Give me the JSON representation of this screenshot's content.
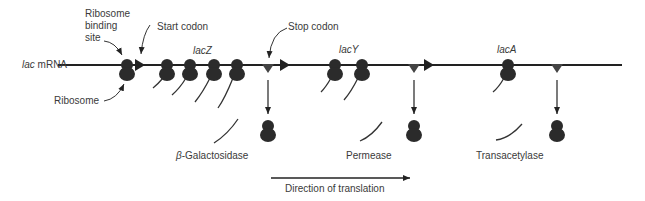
{
  "diagram": {
    "mrna_label_italic": "lac",
    "mrna_label_rest": " mRNA",
    "labels": {
      "ribosome_binding_site": [
        "Ribosome",
        "binding",
        "site"
      ],
      "start_codon": "Start codon",
      "stop_codon": "Stop codon",
      "ribosome": "Ribosome",
      "direction": "Direction of translation"
    },
    "genes": [
      {
        "name": "lacZ",
        "product_prefix": "β",
        "product": "-Galactosidase",
        "ribosomes_translating": 4
      },
      {
        "name": "lacY",
        "product_prefix": "",
        "product": "Permease",
        "ribosomes_translating": 2
      },
      {
        "name": "lacA",
        "product_prefix": "",
        "product": "Transacetylase",
        "ribosomes_translating": 1
      }
    ],
    "colors": {
      "ribosome": "#2b2b2b",
      "line": "#222222",
      "text": "#3a3a3a"
    }
  }
}
